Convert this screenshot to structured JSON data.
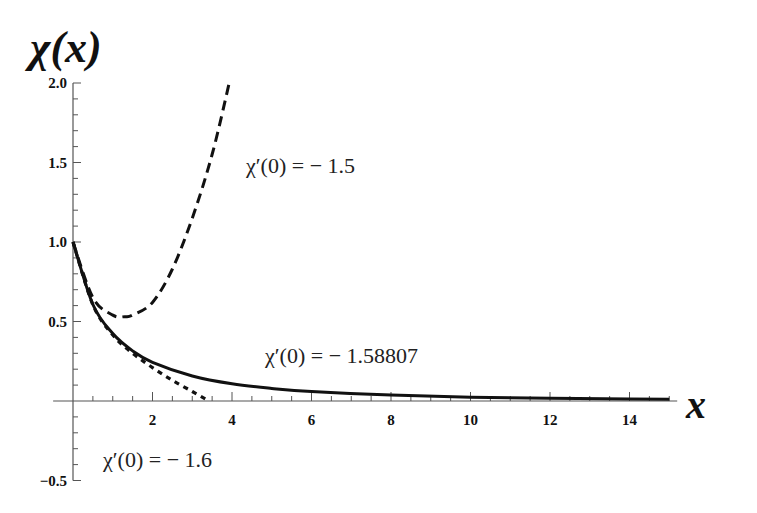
{
  "chart_data": {
    "type": "line",
    "title": "",
    "xlabel": "x",
    "ylabel": "χ(x)",
    "xlim": [
      0,
      15
    ],
    "ylim": [
      -0.5,
      2.0
    ],
    "grid": false,
    "legend": "none (curves annotated inline)",
    "x_ticks": [
      2,
      4,
      6,
      8,
      10,
      12,
      14
    ],
    "x_tick_labels": [
      "2",
      "4",
      "6",
      "8",
      "10",
      "12",
      "14"
    ],
    "y_ticks": [
      -0.5,
      0.5,
      1.0,
      1.5,
      2.0
    ],
    "y_tick_labels": [
      "-0.5",
      "0.5",
      "1.0",
      "1.5",
      "2.0"
    ],
    "series": [
      {
        "name": "χ'(0) = -1.58807",
        "style": "solid",
        "x": [
          0,
          0.5,
          1,
          1.5,
          2,
          3,
          4,
          5,
          6,
          8,
          10,
          12,
          14,
          15
        ],
        "y": [
          1.0,
          0.607,
          0.424,
          0.315,
          0.243,
          0.157,
          0.108,
          0.079,
          0.059,
          0.037,
          0.024,
          0.017,
          0.012,
          0.011
        ]
      },
      {
        "name": "χ'(0) = -1.5",
        "style": "dashed",
        "x": [
          0,
          0.5,
          1,
          1.3,
          1.5,
          2,
          2.5,
          3,
          3.5,
          3.93
        ],
        "y": [
          1.0,
          0.65,
          0.54,
          0.53,
          0.54,
          0.62,
          0.83,
          1.15,
          1.55,
          2.0
        ]
      },
      {
        "name": "χ'(0) = -1.6",
        "style": "dotted",
        "x": [
          0,
          0.5,
          1,
          1.5,
          2,
          2.5,
          3,
          3.42
        ],
        "y": [
          1.0,
          0.605,
          0.415,
          0.3,
          0.21,
          0.13,
          0.06,
          0.0
        ]
      }
    ],
    "annotations": [
      {
        "text": "χ′(0) = − 1.5",
        "x": 4.4,
        "y": 1.48
      },
      {
        "text": "χ′(0) = − 1.58807",
        "x": 4.9,
        "y": 0.37
      },
      {
        "text": "χ′(0) = − 1.6",
        "x": 0.7,
        "y": -0.37
      }
    ]
  },
  "labels": {
    "y_axis_title": "χ(x)",
    "x_axis_title": "x",
    "annot_1": "χ′(0) = − 1.5",
    "annot_2": "χ′(0) = − 1.58807",
    "annot_3": "χ′(0) = − 1.6"
  }
}
